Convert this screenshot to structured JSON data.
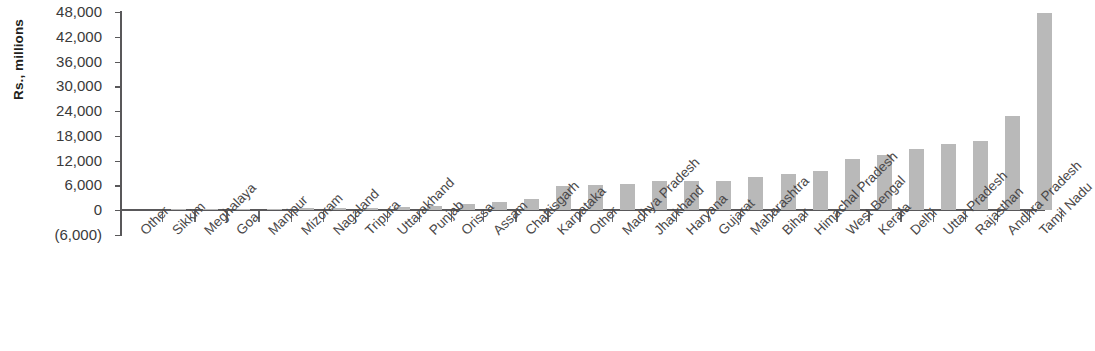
{
  "chart_data": {
    "type": "bar",
    "title": "",
    "subtitle": "",
    "xlabel": "",
    "ylabel": "Rs., millions",
    "ylim": [
      -6000,
      48000
    ],
    "y_ticks": [
      48000,
      42000,
      36000,
      30000,
      24000,
      18000,
      12000,
      6000,
      0,
      -6000
    ],
    "y_tick_labels": [
      "48,000",
      "42,000",
      "36,000",
      "30,000",
      "24,000",
      "18,000",
      "12,000",
      "6,000",
      "0",
      "(6,000)"
    ],
    "grid": false,
    "legend": null,
    "bar_color": "#b9b9b9",
    "axis_color": "#59585a",
    "categories": [
      "Other",
      "Sikkim",
      "Meghalaya",
      "Goa",
      "Manipur",
      "Mizoram",
      "Nagaland",
      "Tripura",
      "Uttarakhand",
      "Punjab",
      "Orissa",
      "Assam",
      "Chattisgarh",
      "Karnataka",
      "Other",
      "Madhya Pradesh",
      "Jharkhand",
      "Haryana",
      "Gujarat",
      "Maharashtra",
      "Bihar",
      "Himachal Pradesh",
      "West Bengal",
      "Kerala",
      "Delhi",
      "Uttar Pradesh",
      "Rajasthan",
      "Andhra Pradesh",
      "Tamil Nadu"
    ],
    "values": [
      0,
      30,
      90,
      260,
      330,
      390,
      410,
      560,
      620,
      1000,
      1500,
      1900,
      2700,
      5900,
      6100,
      6400,
      7100,
      7000,
      7100,
      8100,
      8700,
      9400,
      12300,
      13300,
      14700,
      15900,
      16700,
      22700,
      47800
    ]
  },
  "annotations": {
    "y_axis_unit_note": "Rs., millions"
  }
}
